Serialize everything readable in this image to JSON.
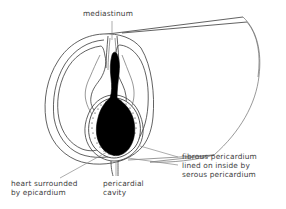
{
  "figure": {
    "background_color": "#ffffff",
    "line_color": "#3a3a3a",
    "leader_color": "#8a8a8a",
    "heart_color": "#000000",
    "text_color": "#3d3d3d"
  },
  "labels": {
    "mediastinum": "mediastinum",
    "heart_line1": "heart surrounded",
    "heart_line2": "by epicardium",
    "cavity_line1": "pericardial",
    "cavity_line2": "cavity",
    "fibrous_line1": "fibrous pericardium",
    "fibrous_line2": "lined on inside by",
    "fibrous_line3": "serous pericardium"
  },
  "structures": [
    {
      "name": "mediastinum",
      "kind": "central-partition"
    },
    {
      "name": "heart",
      "kind": "solid-black-organ"
    },
    {
      "name": "epicardium",
      "kind": "membrane"
    },
    {
      "name": "pericardial-cavity",
      "kind": "stippled-space"
    },
    {
      "name": "fibrous-pericardium",
      "kind": "outer-sac"
    },
    {
      "name": "serous-pericardium",
      "kind": "inner-lining"
    },
    {
      "name": "lung-left",
      "kind": "lobe"
    },
    {
      "name": "lung-right",
      "kind": "lobe"
    },
    {
      "name": "thorax-wall",
      "kind": "body-outline"
    }
  ]
}
